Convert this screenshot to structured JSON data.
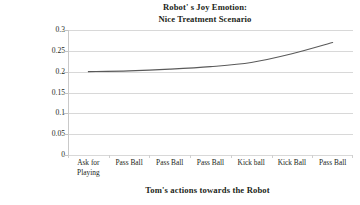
{
  "chart_data": {
    "type": "line",
    "title_lines": [
      "Robot' s Joy Emotion:",
      "Nice Treatment Scenario"
    ],
    "xlabel": "Tom's actions towards the Robot",
    "ylabel": "Emotion Intensity",
    "categories": [
      "Ask for Playing",
      "Pass Ball",
      "Pass Ball",
      "Pass Ball",
      "Kick ball",
      "Kick Ball",
      "Pass Ball"
    ],
    "category_lines": [
      [
        "Ask for",
        "Playing"
      ],
      [
        "Pass Ball"
      ],
      [
        "Pass Ball"
      ],
      [
        "Pass Ball"
      ],
      [
        "Kick ball"
      ],
      [
        "Kick Ball"
      ],
      [
        "Pass Ball"
      ]
    ],
    "values": [
      0.2,
      0.202,
      0.206,
      0.212,
      0.222,
      0.243,
      0.27
    ],
    "series": [
      {
        "name": "Joy",
        "values": [
          0.2,
          0.202,
          0.206,
          0.212,
          0.222,
          0.243,
          0.27
        ],
        "color": "#5a5a5a"
      }
    ],
    "ylim": [
      0,
      0.3
    ],
    "yticks": [
      0,
      0.05,
      0.1,
      0.15,
      0.2,
      0.25,
      0.3
    ],
    "ytick_labels": [
      "0",
      "0.05",
      "0.1",
      "0.15",
      "0.2",
      "0.25",
      "0.3"
    ],
    "grid": true,
    "grid_axis": "y",
    "grid_color": "#d8d8d8",
    "legend": false,
    "legend_position": "none",
    "smooth": true,
    "markers": false,
    "line_color": "#5a5a5a",
    "background_color": "#ffffff",
    "text_color": "#231f20"
  }
}
